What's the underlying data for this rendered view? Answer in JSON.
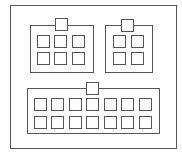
{
  "diagram": {
    "type": "connector-pinout",
    "stroke_color": "#555555",
    "background": "#ffffff",
    "frame": {
      "x": 10,
      "y": 5,
      "w": 166,
      "h": 143
    },
    "connectors": [
      {
        "id": "connector-a",
        "rows": 2,
        "cols": 3,
        "pin_count": 6,
        "body": {
          "x": 30,
          "y": 25,
          "w": 63,
          "h": 47
        },
        "key": {
          "x": 55,
          "y": 18,
          "w": 12,
          "h": 12
        },
        "pin_x": [
          37,
          54,
          72
        ],
        "pin_y": [
          35,
          52
        ],
        "pin_size": 12
      },
      {
        "id": "connector-b",
        "rows": 2,
        "cols": 2,
        "pin_count": 4,
        "body": {
          "x": 105,
          "y": 25,
          "w": 47,
          "h": 47
        },
        "key": {
          "x": 121,
          "y": 19,
          "w": 12,
          "h": 12
        },
        "pin_x": [
          113,
          131
        ],
        "pin_y": [
          35,
          52
        ],
        "pin_size": 12
      },
      {
        "id": "connector-c",
        "rows": 2,
        "cols": 7,
        "pin_count": 14,
        "body": {
          "x": 27,
          "y": 88,
          "w": 132,
          "h": 45
        },
        "key": {
          "x": 86,
          "y": 82,
          "w": 12,
          "h": 12
        },
        "pin_x": [
          34,
          51,
          69,
          86,
          104,
          121,
          139
        ],
        "pin_y": [
          98,
          116
        ],
        "pin_size": 12
      }
    ]
  }
}
